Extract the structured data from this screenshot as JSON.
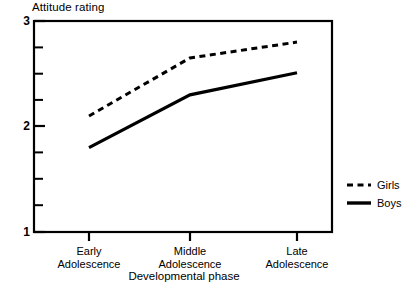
{
  "chart_data": {
    "type": "line",
    "title": "",
    "xlabel": "Developmental phase",
    "ylabel": "Attitude rating",
    "categories": [
      "Early Adolescence",
      "Middle Adolescence",
      "Late Adolescence"
    ],
    "category_lines": [
      [
        "Early",
        "Adolescence"
      ],
      [
        "Middle",
        "Adolescence"
      ],
      [
        "Late",
        "Adolescence"
      ]
    ],
    "series": [
      {
        "name": "Girls",
        "style": "dashed",
        "color": "#000000",
        "values": [
          2.1,
          2.65,
          2.8
        ]
      },
      {
        "name": "Boys",
        "style": "solid",
        "color": "#000000",
        "values": [
          1.8,
          2.3,
          2.51
        ]
      }
    ],
    "ylim": [
      1,
      3
    ],
    "ytick_labels": [
      "1",
      "2",
      "3"
    ],
    "ytick_values": [
      1,
      2,
      3
    ],
    "yminor_ticks": [
      1.25,
      1.5,
      1.75,
      2.25,
      2.5,
      2.75
    ],
    "grid": false,
    "legend_position": "right-outside",
    "legend": [
      {
        "label": "Girls",
        "style": "dashed"
      },
      {
        "label": "Boys",
        "style": "solid"
      }
    ]
  },
  "axes": {
    "y_title": "Attitude rating",
    "x_title": "Developmental phase",
    "y_labels": {
      "top": "3",
      "mid": "2",
      "bottom": "1"
    }
  },
  "legend": {
    "girls_label": "Girls",
    "boys_label": "Boys"
  },
  "xticks": {
    "first_line1": "Early",
    "first_line2": "Adolescence",
    "second_line1": "Middle",
    "second_line2": "Adolescence",
    "third_line1": "Late",
    "third_line2": "Adolescence"
  }
}
